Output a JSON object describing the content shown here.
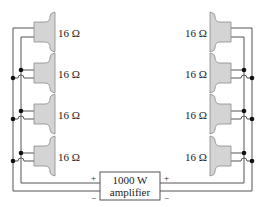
{
  "diagram": {
    "speaker_impedance_label": "16 Ω",
    "left_speakers": [
      {
        "label": "16 Ω"
      },
      {
        "label": "16 Ω"
      },
      {
        "label": "16 Ω"
      },
      {
        "label": "16 Ω"
      }
    ],
    "right_speakers": [
      {
        "label": "16 Ω"
      },
      {
        "label": "16 Ω"
      },
      {
        "label": "16 Ω"
      },
      {
        "label": "16 Ω"
      }
    ],
    "amplifier": {
      "line1": "1000 W",
      "line2": "amplifier",
      "left_plus": "+",
      "left_minus": "−",
      "right_plus": "+",
      "right_minus": "−"
    },
    "colors": {
      "speaker_fill": "#d4d4d4",
      "wire": "#555555",
      "junction": "#111111"
    }
  }
}
